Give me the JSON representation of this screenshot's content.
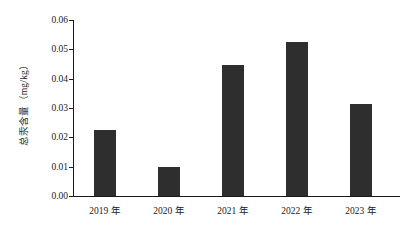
{
  "chart_data": {
    "type": "bar",
    "title": "",
    "subtitle": "",
    "xlabel": "",
    "ylabel": "总汞含量（mg/kg）",
    "categories": [
      "2019 年",
      "2020 年",
      "2021 年",
      "2022 年",
      "2023 年"
    ],
    "values": [
      0.0225,
      0.01,
      0.0445,
      0.0525,
      0.0315
    ],
    "series": [
      {
        "name": "总汞含量",
        "values": [
          0.0225,
          0.01,
          0.0445,
          0.0525,
          0.0315
        ]
      }
    ],
    "ylim": [
      0.0,
      0.06
    ],
    "ytick_values": [
      0.0,
      0.01,
      0.02,
      0.03,
      0.04,
      0.05,
      0.06
    ],
    "ytick_labels": [
      "0.00",
      "0.01",
      "0.02",
      "0.03",
      "0.04",
      "0.05",
      "0.06"
    ],
    "grid": false,
    "legend": false,
    "legend_position": "none",
    "annotations": [],
    "bar_color": "#2e2e2e",
    "axis_color": "#1a1a1a",
    "background_color": "#ffffff"
  }
}
